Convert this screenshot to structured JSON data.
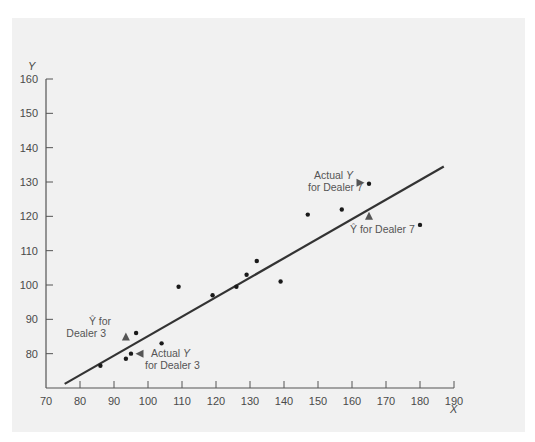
{
  "chart_data": {
    "type": "scatter",
    "title": "",
    "xlabel": "X",
    "ylabel": "Y",
    "xlim": [
      70,
      190
    ],
    "ylim": [
      70,
      160
    ],
    "grid": false,
    "x_ticks": [
      70,
      80,
      90,
      100,
      110,
      120,
      130,
      140,
      150,
      160,
      170,
      180,
      190
    ],
    "y_ticks": [
      80,
      90,
      100,
      110,
      120,
      130,
      140,
      150,
      160
    ],
    "series": [
      {
        "name": "observations",
        "points": [
          {
            "x": 86,
            "y": 76.5
          },
          {
            "x": 93.5,
            "y": 78.5
          },
          {
            "x": 95,
            "y": 80
          },
          {
            "x": 96.5,
            "y": 86
          },
          {
            "x": 104,
            "y": 83
          },
          {
            "x": 109,
            "y": 99.5
          },
          {
            "x": 119,
            "y": 97
          },
          {
            "x": 126,
            "y": 99.5
          },
          {
            "x": 129,
            "y": 103
          },
          {
            "x": 132,
            "y": 107
          },
          {
            "x": 139,
            "y": 101
          },
          {
            "x": 147,
            "y": 120.5
          },
          {
            "x": 157,
            "y": 122
          },
          {
            "x": 165,
            "y": 129.5
          },
          {
            "x": 180,
            "y": 117.5
          }
        ]
      }
    ],
    "regression_line": {
      "x1": 75.5,
      "y1": 71.2,
      "x2": 187,
      "y2": 134.5
    },
    "annotations": [
      {
        "id": "yhat-dealer3",
        "lines": [
          "Ŷ for",
          "Dealer 3"
        ],
        "marker": "triangle-up",
        "marker_x": 93.5,
        "marker_y": 85
      },
      {
        "id": "actual-dealer3",
        "lines": [
          "Actual Y",
          "for Dealer 3"
        ],
        "marker": "triangle-left",
        "marker_x": 97.5,
        "marker_y": 80
      },
      {
        "id": "actual-dealer7",
        "lines": [
          "Actual Y",
          "for Dealer 7"
        ],
        "marker": "triangle-right",
        "marker_x": 162.5,
        "marker_y": 129.8
      },
      {
        "id": "yhat-dealer7",
        "lines": [
          "Ŷ for Dealer 7"
        ],
        "marker": "triangle-up",
        "marker_x": 165,
        "marker_y": 120.2
      }
    ]
  },
  "labels": {
    "x_axis_title": "X",
    "y_axis_title": "Y",
    "yhat_dealer3_line1": "Ŷ for",
    "yhat_dealer3_line2": "Dealer 3",
    "actual_dealer3_line1a": "Actual ",
    "actual_dealer3_line1b": "Y",
    "actual_dealer3_line2": "for Dealer 3",
    "actual_dealer7_line1a": "Actual ",
    "actual_dealer7_line1b": "Y",
    "actual_dealer7_line2": "for Dealer 7",
    "yhat_dealer7": "Ŷ for Dealer 7"
  },
  "colors": {
    "background": "#ffffff",
    "panel": "#f1f1f1",
    "axis": "#555555",
    "line": "#333333",
    "points": "#1a1a1a",
    "markers": "#555555",
    "text": "#4a4a4a"
  }
}
